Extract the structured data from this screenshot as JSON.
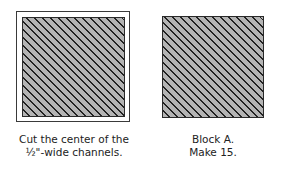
{
  "figures": [
    {
      "id": "left",
      "description": "Hatched square inside outer frame",
      "caption_lines": [
        "Cut the center of the",
        "½\"-wide channels."
      ]
    },
    {
      "id": "right",
      "description": "Hatched square block",
      "caption_lines": [
        "Block A.",
        "Make 15."
      ]
    }
  ],
  "colors": {
    "fill": "#b4b4b4",
    "hatch_line": "#222222",
    "frame": "#3a3a3a",
    "text": "#222222"
  }
}
